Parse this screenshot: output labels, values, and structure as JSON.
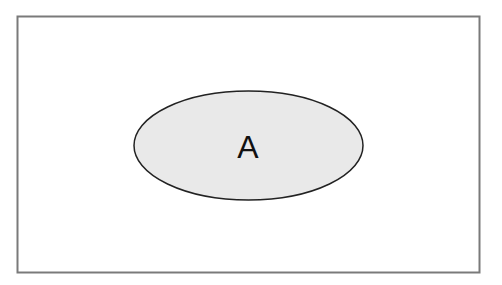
{
  "diagram": {
    "type": "venn",
    "universe": {
      "label": "",
      "stroke": "#7a7a7a",
      "fill": "#ffffff"
    },
    "sets": [
      {
        "label": "A",
        "fill": "#e9e9e9",
        "stroke": "#222222"
      }
    ]
  }
}
